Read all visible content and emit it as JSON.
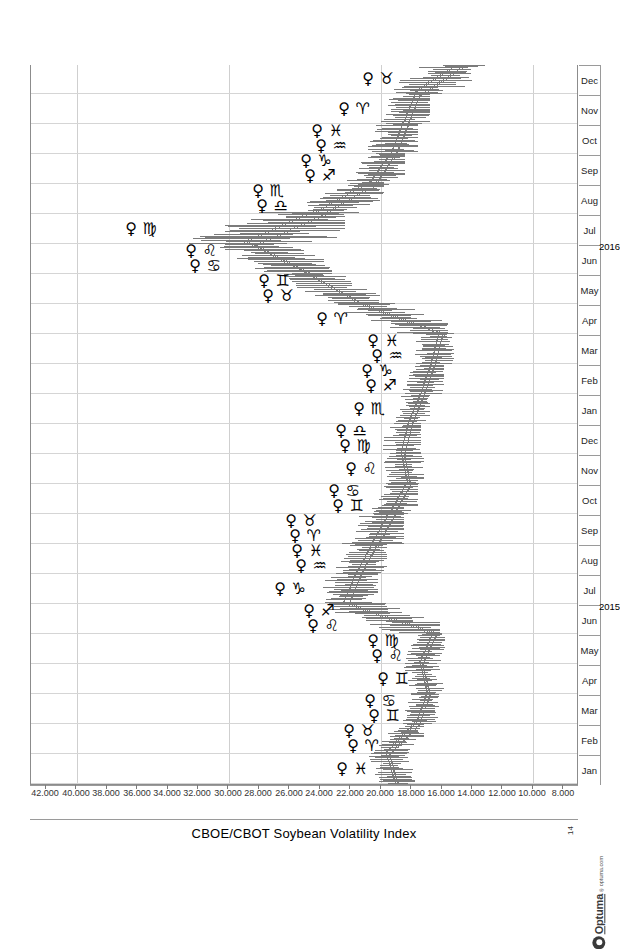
{
  "chart_data": {
    "type": "line",
    "title": "CBOE/CBOT Soybean Volatility Index",
    "subtitle": "",
    "xlabel": "",
    "ylabel": "",
    "orientation": "rotated-90-landscape-on-portrait",
    "grid": true,
    "legend_position": "none",
    "ylim": [
      7000,
      43000
    ],
    "yticks": [
      "42.000",
      "40.000",
      "38.000",
      "36.000",
      "34.000",
      "32.000",
      "30.000",
      "28.000",
      "26.000",
      "24.000",
      "22.000",
      "20.000",
      "18.000",
      "16.000",
      "14.000",
      "12.000",
      "10.000",
      "8.000"
    ],
    "ytick_values": [
      42000,
      40000,
      38000,
      36000,
      34000,
      32000,
      30000,
      28000,
      26000,
      24000,
      22000,
      20000,
      18000,
      16000,
      14000,
      12000,
      10000,
      8000
    ],
    "gridline_values": [
      40000,
      30000,
      20000,
      10000
    ],
    "xtick_labels": [
      "Jan",
      "Feb",
      "Mar",
      "Apr",
      "May",
      "Jun",
      "Jul",
      "Aug",
      "Sep",
      "Oct",
      "Nov",
      "Dec",
      "Jan",
      "Feb",
      "Mar",
      "Apr",
      "May",
      "Jun",
      "Jul",
      "Aug",
      "Sep",
      "Oct",
      "Nov",
      "Dec"
    ],
    "year_labels": [
      "2015",
      "2016"
    ],
    "series": [
      {
        "name": "CBOE/CBOT Soybean Volatility Index",
        "style": "ohlc-bars",
        "color": "#7b7b7b",
        "points": [
          {
            "t": "2015-01",
            "open": 19000,
            "high": 21500,
            "low": 17800,
            "close": 19600
          },
          {
            "t": "2015-02",
            "open": 19600,
            "high": 20800,
            "low": 17200,
            "close": 17600
          },
          {
            "t": "2015-03",
            "open": 17600,
            "high": 19400,
            "low": 16200,
            "close": 16900
          },
          {
            "t": "2015-04",
            "open": 16900,
            "high": 18800,
            "low": 15600,
            "close": 17400
          },
          {
            "t": "2015-05",
            "open": 17400,
            "high": 19200,
            "low": 15800,
            "close": 16500
          },
          {
            "t": "2015-06",
            "open": 16500,
            "high": 23400,
            "low": 16100,
            "close": 22300
          },
          {
            "t": "2015-07",
            "open": 22300,
            "high": 25600,
            "low": 20200,
            "close": 21500
          },
          {
            "t": "2015-08",
            "open": 21500,
            "high": 24200,
            "low": 19600,
            "close": 20400
          },
          {
            "t": "2015-09",
            "open": 20400,
            "high": 24600,
            "low": 18500,
            "close": 19300
          },
          {
            "t": "2015-10",
            "open": 19300,
            "high": 21800,
            "low": 17600,
            "close": 18200
          },
          {
            "t": "2015-11",
            "open": 18200,
            "high": 20900,
            "low": 17200,
            "close": 18600
          },
          {
            "t": "2015-12",
            "open": 18600,
            "high": 21300,
            "low": 17400,
            "close": 18100
          },
          {
            "t": "2016-01",
            "open": 18100,
            "high": 20400,
            "low": 16800,
            "close": 17300
          },
          {
            "t": "2016-02",
            "open": 17300,
            "high": 19600,
            "low": 15900,
            "close": 16600
          },
          {
            "t": "2016-03",
            "open": 16600,
            "high": 19200,
            "low": 15200,
            "close": 16100
          },
          {
            "t": "2016-04",
            "open": 16100,
            "high": 22800,
            "low": 15600,
            "close": 21400
          },
          {
            "t": "2016-05",
            "open": 21400,
            "high": 26400,
            "low": 20100,
            "close": 24800
          },
          {
            "t": "2016-06",
            "open": 24800,
            "high": 31200,
            "low": 23200,
            "close": 28600
          },
          {
            "t": "2016-07",
            "open": 28600,
            "high": 35400,
            "low": 22400,
            "close": 24100
          },
          {
            "t": "2016-08",
            "open": 24100,
            "high": 26800,
            "low": 19800,
            "close": 20600
          },
          {
            "t": "2016-09",
            "open": 20600,
            "high": 23600,
            "low": 18400,
            "close": 19200
          },
          {
            "t": "2016-10",
            "open": 19200,
            "high": 22900,
            "low": 17600,
            "close": 18400
          },
          {
            "t": "2016-11",
            "open": 18400,
            "high": 21400,
            "low": 16800,
            "close": 17600
          },
          {
            "t": "2016-12",
            "open": 17600,
            "high": 19800,
            "low": 13200,
            "close": 14600
          }
        ]
      }
    ],
    "annotations": {
      "name": "Venus zodiac ingress markers",
      "glyph_planet": "♀",
      "items": [
        {
          "sign": "Pisces",
          "glyph": "♓",
          "t": "2015-01"
        },
        {
          "sign": "Aries",
          "glyph": "♈",
          "t": "2015-02"
        },
        {
          "sign": "Taurus",
          "glyph": "♉",
          "t": "2015-02"
        },
        {
          "sign": "Gemini",
          "glyph": "♊",
          "t": "2015-03"
        },
        {
          "sign": "Cancer",
          "glyph": "♋",
          "t": "2015-03"
        },
        {
          "sign": "Gemini",
          "glyph": "♊",
          "t": "2015-04"
        },
        {
          "sign": "Leo",
          "glyph": "♌",
          "t": "2015-05"
        },
        {
          "sign": "Virgo",
          "glyph": "♍",
          "t": "2015-05"
        },
        {
          "sign": "Leo",
          "glyph": "♌",
          "t": "2015-06"
        },
        {
          "sign": "Sagittarius",
          "glyph": "♐",
          "t": "2015-06"
        },
        {
          "sign": "Capricorn",
          "glyph": "♑",
          "t": "2015-07"
        },
        {
          "sign": "Aquarius",
          "glyph": "♒",
          "t": "2015-08"
        },
        {
          "sign": "Pisces",
          "glyph": "♓",
          "t": "2015-08"
        },
        {
          "sign": "Aries",
          "glyph": "♈",
          "t": "2015-09"
        },
        {
          "sign": "Taurus",
          "glyph": "♉",
          "t": "2015-09"
        },
        {
          "sign": "Gemini",
          "glyph": "♊",
          "t": "2015-10"
        },
        {
          "sign": "Cancer",
          "glyph": "♋",
          "t": "2015-10"
        },
        {
          "sign": "Leo",
          "glyph": "♌",
          "t": "2015-11"
        },
        {
          "sign": "Virgo",
          "glyph": "♍",
          "t": "2015-12"
        },
        {
          "sign": "Libra",
          "glyph": "♎",
          "t": "2015-12"
        },
        {
          "sign": "Scorpio",
          "glyph": "♏",
          "t": "2016-01"
        },
        {
          "sign": "Sagittarius",
          "glyph": "♐",
          "t": "2016-02"
        },
        {
          "sign": "Capricorn",
          "glyph": "♑",
          "t": "2016-02"
        },
        {
          "sign": "Aquarius",
          "glyph": "♒",
          "t": "2016-03"
        },
        {
          "sign": "Pisces",
          "glyph": "♓",
          "t": "2016-03"
        },
        {
          "sign": "Aries",
          "glyph": "♈",
          "t": "2016-04"
        },
        {
          "sign": "Taurus",
          "glyph": "♉",
          "t": "2016-05"
        },
        {
          "sign": "Gemini",
          "glyph": "♊",
          "t": "2016-05"
        },
        {
          "sign": "Cancer",
          "glyph": "♋",
          "t": "2016-06"
        },
        {
          "sign": "Leo",
          "glyph": "♌",
          "t": "2016-06"
        },
        {
          "sign": "Virgo",
          "glyph": "♍",
          "t": "2016-07"
        },
        {
          "sign": "Libra",
          "glyph": "♎",
          "t": "2016-08"
        },
        {
          "sign": "Scorpio",
          "glyph": "♏",
          "t": "2016-08"
        },
        {
          "sign": "Sagittarius",
          "glyph": "♐",
          "t": "2016-09"
        },
        {
          "sign": "Capricorn",
          "glyph": "♑",
          "t": "2016-09"
        },
        {
          "sign": "Aquarius",
          "glyph": "♒",
          "t": "2016-10"
        },
        {
          "sign": "Pisces",
          "glyph": "♓",
          "t": "2016-10"
        },
        {
          "sign": "Aries",
          "glyph": "♈",
          "t": "2016-11"
        },
        {
          "sign": "Taurus",
          "glyph": "♉",
          "t": "2016-12"
        }
      ]
    }
  },
  "branding": {
    "name": "Optuma",
    "trademark": "®",
    "url": "optuma.com"
  },
  "page": {
    "corner_number": "14"
  }
}
